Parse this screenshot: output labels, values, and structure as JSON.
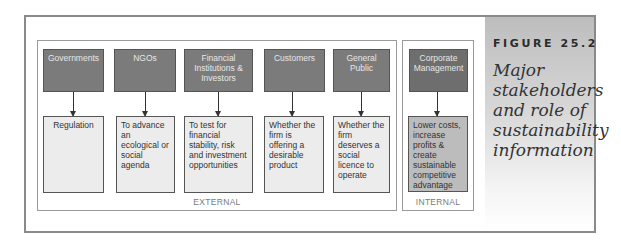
{
  "figure": {
    "label": "FIGURE 25.2",
    "title": "Major stakeholders and role of sustainability information"
  },
  "groups": {
    "external": {
      "label": "EXTERNAL",
      "stakeholders": [
        {
          "name": "Governments",
          "role": "Regulation"
        },
        {
          "name": "NGOs",
          "role": "To advance an ecological or social agenda"
        },
        {
          "name": "Financial Institutions & Investors",
          "role": "To test for financial stability, risk and investment opportunities"
        },
        {
          "name": "Customers",
          "role": "Whether the firm is offering a desirable product"
        },
        {
          "name": "General Public",
          "role": "Whether the firm deserves a social licence to operate"
        }
      ]
    },
    "internal": {
      "label": "INTERNAL",
      "stakeholders": [
        {
          "name": "Corporate Management",
          "role": "Lower costs, increase profits & create sustainable competitive advantage"
        }
      ]
    }
  },
  "colors": {
    "header_fill": "#7b7b7b",
    "role_fill_external": "#ececec",
    "role_fill_internal": "#bcbcbc",
    "frame": "#8a8a8a"
  }
}
